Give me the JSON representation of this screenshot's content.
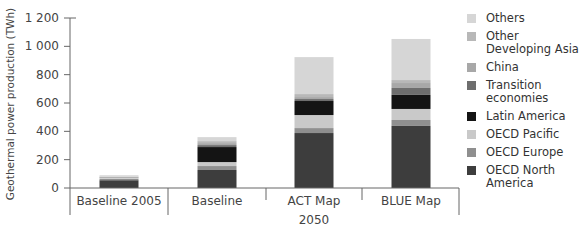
{
  "chart_data": {
    "type": "bar",
    "stacked": true,
    "title": "",
    "xlabel": "",
    "ylabel": "Geothermal power production (TWh)",
    "ylim": [
      0,
      1200
    ],
    "yticks": [
      0,
      200,
      400,
      600,
      800,
      1000,
      1200
    ],
    "ytick_labels": [
      "0",
      "200",
      "400",
      "600",
      "800",
      "1 000",
      "1 200"
    ],
    "grid": false,
    "legend_position": "right",
    "categories": [
      "Baseline 2005",
      "Baseline",
      "ACT Map",
      "BLUE Map"
    ],
    "category_group": {
      "label": "2050",
      "members": [
        "Baseline",
        "ACT Map",
        "BLUE Map"
      ]
    },
    "series": [
      {
        "name": "OECD North America",
        "color": "#3d3d3d",
        "values": [
          55,
          127,
          388,
          438
        ]
      },
      {
        "name": "OECD Europe",
        "color": "#8f8f8f",
        "values": [
          10,
          28,
          35,
          42
        ]
      },
      {
        "name": "OECD Pacific",
        "color": "#c9c9c9",
        "values": [
          8,
          28,
          92,
          78
        ]
      },
      {
        "name": "Latin America",
        "color": "#141414",
        "values": [
          2,
          106,
          99,
          99
        ]
      },
      {
        "name": "Transition economies",
        "color": "#6e6e6e",
        "values": [
          0,
          14,
          14,
          49
        ]
      },
      {
        "name": "China",
        "color": "#a8a8a8",
        "values": [
          0,
          14,
          14,
          35
        ]
      },
      {
        "name": "Other Developing Asia",
        "color": "#b8b8b8",
        "values": [
          5,
          14,
          21,
          21
        ]
      },
      {
        "name": "Others",
        "color": "#d6d6d6",
        "values": [
          10,
          28,
          261,
          290
        ]
      }
    ]
  },
  "legend": {
    "items": [
      {
        "label": "Others",
        "color": "#d6d6d6"
      },
      {
        "label": "Other Developing Asia",
        "color": "#b8b8b8"
      },
      {
        "label": "China",
        "color": "#a8a8a8"
      },
      {
        "label": "Transition economies",
        "color": "#6e6e6e"
      },
      {
        "label": "Latin America",
        "color": "#141414"
      },
      {
        "label": "OECD Pacific",
        "color": "#c9c9c9"
      },
      {
        "label": "OECD Europe",
        "color": "#8f8f8f"
      },
      {
        "label": "OECD North America",
        "color": "#3d3d3d"
      }
    ]
  }
}
